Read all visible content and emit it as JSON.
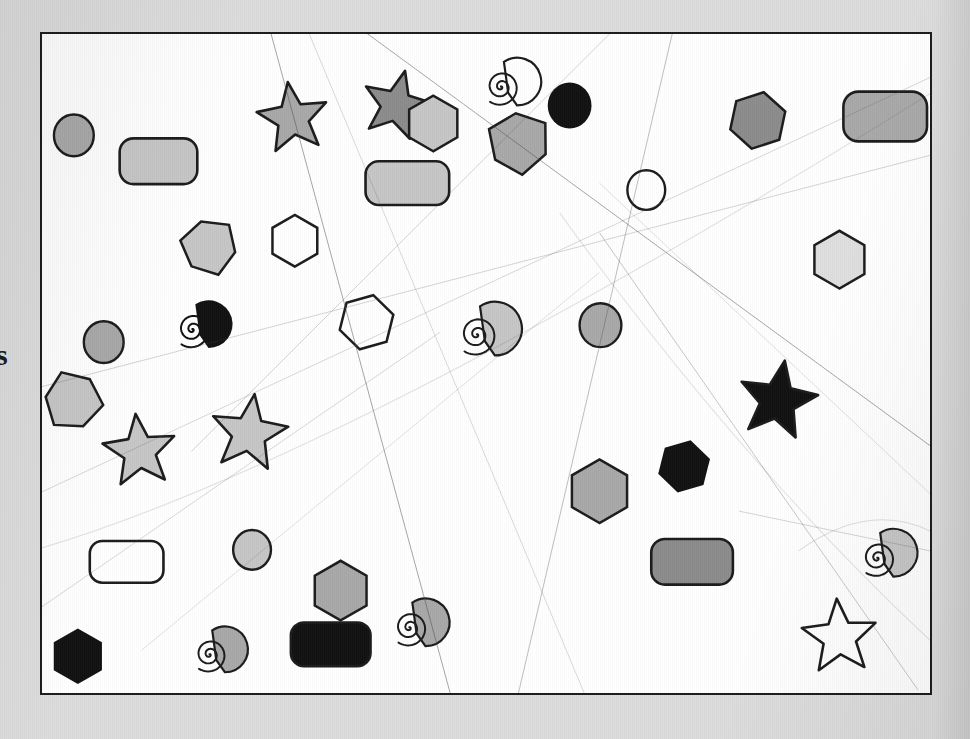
{
  "page": {
    "background_color": "#dcdcdc",
    "canvas_background": "#ffffff",
    "canvas_border_color": "#1c1c1c",
    "edge_text": "s"
  },
  "palette": {
    "black": "#111111",
    "dark_gray": "#8c8c8c",
    "mid_gray": "#a8a8a8",
    "light_gray": "#c6c6c6",
    "pale_gray": "#dedede",
    "white": "#ffffff",
    "outline": "#1c1c1c"
  },
  "chart_data": {
    "type": "scatter",
    "xlabel": "",
    "ylabel": "",
    "xlim": [
      0,
      892
    ],
    "ylim": [
      0,
      663
    ],
    "grid": false,
    "legend": "none",
    "shape_counts": {
      "star": 6,
      "hexagon": 9,
      "circle": 6,
      "rounded_rect": 6,
      "spiral": 5,
      "pentagon": 3
    },
    "distractor_line_count": 12,
    "total_shapes": 35,
    "series": [
      {
        "name": "shapes",
        "values": [
          {
            "id": 1,
            "shape": "star",
            "x": 215,
            "y": 48,
            "size": 74,
            "fill": "#a8a8a8",
            "rot": -8
          },
          {
            "id": 2,
            "shape": "star",
            "x": 320,
            "y": 36,
            "size": 72,
            "fill": "#8c8c8c",
            "rot": 14
          },
          {
            "id": 3,
            "shape": "spiral",
            "x": 440,
            "y": 28,
            "size": 48,
            "fill": "none",
            "rot": 0
          },
          {
            "id": 4,
            "shape": "circle",
            "x": 508,
            "y": 50,
            "size": 44,
            "fill": "#111111",
            "rot": 0
          },
          {
            "id": 5,
            "shape": "hexagon",
            "x": 690,
            "y": 58,
            "size": 58,
            "fill": "#8c8c8c",
            "rot": 12
          },
          {
            "id": 6,
            "shape": "rounded_rect",
            "x": 805,
            "y": 58,
            "w": 84,
            "h": 50,
            "fill": "#a8a8a8",
            "rot": 0
          },
          {
            "id": 7,
            "shape": "hexagon",
            "x": 365,
            "y": 62,
            "size": 56,
            "fill": "#c6c6c6",
            "rot": 0
          },
          {
            "id": 8,
            "shape": "pentagon",
            "x": 448,
            "y": 78,
            "size": 62,
            "fill": "#a8a8a8",
            "rot": 22
          },
          {
            "id": 9,
            "shape": "circle",
            "x": 12,
            "y": 82,
            "size": 40,
            "fill": "#a8a8a8",
            "rot": 0
          },
          {
            "id": 10,
            "shape": "rounded_rect",
            "x": 78,
            "y": 105,
            "w": 78,
            "h": 46,
            "fill": "#c6c6c6",
            "rot": 0
          },
          {
            "id": 11,
            "shape": "rounded_rect",
            "x": 325,
            "y": 128,
            "w": 84,
            "h": 44,
            "fill": "#c6c6c6",
            "rot": 0
          },
          {
            "id": 12,
            "shape": "circle",
            "x": 588,
            "y": 138,
            "size": 38,
            "fill": "#ffffff",
            "rot": 0
          },
          {
            "id": 13,
            "shape": "pentagon",
            "x": 140,
            "y": 186,
            "size": 56,
            "fill": "#c6c6c6",
            "rot": 16
          },
          {
            "id": 14,
            "shape": "hexagon",
            "x": 228,
            "y": 182,
            "size": 52,
            "fill": "#ffffff",
            "rot": 0
          },
          {
            "id": 15,
            "shape": "hexagon",
            "x": 772,
            "y": 198,
            "size": 58,
            "fill": "#dedede",
            "rot": 0
          },
          {
            "id": 16,
            "shape": "spiral",
            "x": 130,
            "y": 272,
            "size": 48,
            "fill": "#111111",
            "rot": 0
          },
          {
            "id": 17,
            "shape": "circle",
            "x": 42,
            "y": 290,
            "size": 40,
            "fill": "#a8a8a8",
            "rot": 0
          },
          {
            "id": 18,
            "shape": "hexagon",
            "x": 298,
            "y": 262,
            "size": 56,
            "fill": "#ffffff",
            "rot": 14
          },
          {
            "id": 19,
            "shape": "spiral",
            "x": 413,
            "y": 274,
            "size": 54,
            "fill": "#c6c6c6",
            "rot": 0
          },
          {
            "id": 20,
            "shape": "circle",
            "x": 540,
            "y": 272,
            "size": 42,
            "fill": "#a8a8a8",
            "rot": 0
          },
          {
            "id": 21,
            "shape": "pentagon",
            "x": 2,
            "y": 340,
            "size": 58,
            "fill": "#c6c6c6",
            "rot": -16
          },
          {
            "id": 22,
            "shape": "star",
            "x": 60,
            "y": 382,
            "size": 76,
            "fill": "#c6c6c6",
            "rot": -6
          },
          {
            "id": 23,
            "shape": "star",
            "x": 168,
            "y": 362,
            "size": 80,
            "fill": "#c6c6c6",
            "rot": 8
          },
          {
            "id": 24,
            "shape": "star",
            "x": 698,
            "y": 328,
            "size": 82,
            "fill": "#111111",
            "rot": 10
          },
          {
            "id": 25,
            "shape": "hexagon",
            "x": 528,
            "y": 428,
            "size": 64,
            "fill": "#a8a8a8",
            "rot": 0
          },
          {
            "id": 26,
            "shape": "hexagon",
            "x": 618,
            "y": 408,
            "size": 54,
            "fill": "#111111",
            "rot": 14
          },
          {
            "id": 27,
            "shape": "rounded_rect",
            "x": 48,
            "y": 510,
            "w": 74,
            "h": 42,
            "fill": "#ffffff",
            "rot": 0
          },
          {
            "id": 28,
            "shape": "circle",
            "x": 192,
            "y": 500,
            "size": 38,
            "fill": "#c6c6c6",
            "rot": 0
          },
          {
            "id": 29,
            "shape": "rounded_rect",
            "x": 612,
            "y": 508,
            "w": 82,
            "h": 46,
            "fill": "#8c8c8c",
            "rot": 0
          },
          {
            "id": 30,
            "shape": "spiral",
            "x": 818,
            "y": 502,
            "size": 48,
            "fill": "#c6c6c6",
            "rot": 0
          },
          {
            "id": 31,
            "shape": "hexagon",
            "x": 270,
            "y": 530,
            "size": 60,
            "fill": "#a8a8a8",
            "rot": 0
          },
          {
            "id": 32,
            "shape": "spiral",
            "x": 348,
            "y": 572,
            "size": 48,
            "fill": "#a8a8a8",
            "rot": 0
          },
          {
            "id": 33,
            "shape": "rounded_rect",
            "x": 250,
            "y": 592,
            "w": 80,
            "h": 44,
            "fill": "#111111",
            "rot": 0
          },
          {
            "id": 34,
            "shape": "hexagon",
            "x": 8,
            "y": 598,
            "size": 56,
            "fill": "#111111",
            "rot": 0
          },
          {
            "id": 35,
            "shape": "star",
            "x": 762,
            "y": 568,
            "size": 78,
            "fill": "#ffffff",
            "rot": -4
          },
          {
            "id": 36,
            "shape": "spiral",
            "x": 148,
            "y": 600,
            "size": 46,
            "fill": "#a8a8a8",
            "rot": 0
          }
        ]
      }
    ],
    "distractor_lines": [
      {
        "id": "L1",
        "x1": 222,
        "y1": -30,
        "x2": 420,
        "y2": 700,
        "width": 0.9,
        "opacity": 0.55
      },
      {
        "id": "L2",
        "x1": 256,
        "y1": -30,
        "x2": 560,
        "y2": 700,
        "width": 0.7,
        "opacity": 0.3
      },
      {
        "id": "L3",
        "x1": 300,
        "y1": -20,
        "x2": 900,
        "y2": 420,
        "width": 0.9,
        "opacity": 0.55
      },
      {
        "id": "L4",
        "x1": 640,
        "y1": -30,
        "x2": 470,
        "y2": 700,
        "width": 0.8,
        "opacity": 0.45
      },
      {
        "id": "L5",
        "x1": 600,
        "y1": -30,
        "x2": 150,
        "y2": 420,
        "width": 0.7,
        "opacity": 0.35
      },
      {
        "id": "L6",
        "x1": -20,
        "y1": 360,
        "x2": 900,
        "y2": 120,
        "width": 0.8,
        "opacity": 0.3
      },
      {
        "id": "L7",
        "x1": -20,
        "y1": 470,
        "x2": 900,
        "y2": 40,
        "width": 0.9,
        "opacity": 0.25
      },
      {
        "id": "L8",
        "x1": 560,
        "y1": 150,
        "x2": 900,
        "y2": 470,
        "width": 0.8,
        "opacity": 0.22
      },
      {
        "id": "L9",
        "x1": -20,
        "y1": 590,
        "x2": 400,
        "y2": 300,
        "width": 0.8,
        "opacity": 0.28
      },
      {
        "id": "L10",
        "x1": 560,
        "y1": 200,
        "x2": 880,
        "y2": 660,
        "width": 0.9,
        "opacity": 0.35
      },
      {
        "id": "L11",
        "x1": 100,
        "y1": 620,
        "x2": 560,
        "y2": 240,
        "width": 0.8,
        "opacity": 0.22
      },
      {
        "id": "L12",
        "x1": 700,
        "y1": 480,
        "x2": 892,
        "y2": 520,
        "width": 0.8,
        "opacity": 0.3
      }
    ]
  }
}
